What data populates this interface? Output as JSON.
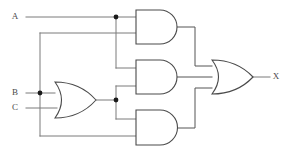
{
  "diagram": {
    "type": "combinational-logic-circuit",
    "background_color": "#ffffff",
    "wire_color": "#7a7a7a",
    "gate_outline_color": "#4a4a4a",
    "junction_color": "#1a1a1a",
    "label_color": "#4a4a4a"
  },
  "inputs": [
    {
      "id": "A",
      "label": "A",
      "label_x": 18,
      "label_y": 17,
      "wire_y": 17
    },
    {
      "id": "B",
      "label": "B",
      "label_x": 18,
      "label_y": 93,
      "wire_y": 93
    },
    {
      "id": "C",
      "label": "C",
      "label_x": 18,
      "label_y": 108,
      "wire_y": 108
    }
  ],
  "outputs": [
    {
      "id": "X",
      "label": "X",
      "label_x": 274,
      "label_y": 77,
      "wire_y": 77
    }
  ],
  "gates": [
    {
      "id": "or1",
      "name": "or-gate-bc",
      "type": "OR",
      "symbol_label": "OR",
      "x": 55,
      "y": 82,
      "width": 41,
      "height": 36,
      "inputs": [
        "B",
        "C"
      ],
      "output": "B+C"
    },
    {
      "id": "and1",
      "name": "and-gate-top",
      "type": "AND",
      "symbol_label": "AND",
      "x": 136,
      "y": 10,
      "width": 41,
      "height": 34,
      "inputs": [
        "A",
        "B"
      ],
      "output": "A*B"
    },
    {
      "id": "and2",
      "name": "and-gate-middle",
      "type": "AND",
      "symbol_label": "AND",
      "x": 136,
      "y": 60,
      "width": 41,
      "height": 34,
      "inputs": [
        "A",
        "B+C"
      ],
      "output": "A*(B+C)"
    },
    {
      "id": "and3",
      "name": "and-gate-bottom",
      "type": "AND",
      "symbol_label": "AND",
      "x": 136,
      "y": 110,
      "width": 41,
      "height": 35,
      "inputs": [
        "B+C",
        "B"
      ],
      "output": "(B+C)*B"
    },
    {
      "id": "or2",
      "name": "or-gate-output",
      "type": "OR",
      "symbol_label": "OR",
      "x": 212,
      "y": 60,
      "width": 41,
      "height": 34,
      "inputs": [
        "A*B",
        "A*(B+C)",
        "(B+C)*B"
      ],
      "output": "X"
    }
  ],
  "junctions": [
    {
      "id": "j-a",
      "name": "junction-a-branch",
      "x": 116,
      "y": 17
    },
    {
      "id": "j-b",
      "name": "junction-b-branch",
      "x": 40,
      "y": 93
    },
    {
      "id": "j-or1",
      "name": "junction-or1-output",
      "x": 116,
      "y": 100
    }
  ],
  "wires": [
    {
      "id": "w-a-in",
      "name": "wire-a-input",
      "path": "M 26 17 L 116 17"
    },
    {
      "id": "w-a-and1",
      "name": "wire-a-to-and1",
      "path": "M 116 17 L 136 17"
    },
    {
      "id": "w-a-down",
      "name": "wire-a-branch-down",
      "path": "M 116 17 L 116 68"
    },
    {
      "id": "w-a-and2",
      "name": "wire-a-to-and2",
      "path": "M 116 68 L 136 68"
    },
    {
      "id": "w-b-in",
      "name": "wire-b-input",
      "path": "M 26 93 L 55 93"
    },
    {
      "id": "w-c-in",
      "name": "wire-c-input",
      "path": "M 26 108 L 57 108"
    },
    {
      "id": "w-b-up",
      "name": "wire-b-branch-up",
      "path": "M 40 93 L 40 33"
    },
    {
      "id": "w-b-top",
      "name": "wire-b-to-and1",
      "path": "M 40 33 L 136 33"
    },
    {
      "id": "w-b-down",
      "name": "wire-b-branch-down",
      "path": "M 40 93 L 40 136"
    },
    {
      "id": "w-b-bottom",
      "name": "wire-b-to-and3",
      "path": "M 40 136 L 136 136"
    },
    {
      "id": "w-or1-out",
      "name": "wire-or1-output",
      "path": "M 96 100 L 116 100"
    },
    {
      "id": "w-or1-up",
      "name": "wire-or1-branch-up",
      "path": "M 116 100 L 116 86"
    },
    {
      "id": "w-or1-and2",
      "name": "wire-or1-to-and2",
      "path": "M 116 86 L 136 86"
    },
    {
      "id": "w-or1-dn",
      "name": "wire-or1-branch-down",
      "path": "M 116 100 L 116 119"
    },
    {
      "id": "w-or1-and3",
      "name": "wire-or1-to-and3",
      "path": "M 116 119 L 136 119"
    },
    {
      "id": "w-and1-out",
      "name": "wire-and1-to-or2",
      "path": "M 177 27 L 195 27 L 195 66 L 212 66"
    },
    {
      "id": "w-and2-out",
      "name": "wire-and2-to-or2",
      "path": "M 177 77 L 212 77"
    },
    {
      "id": "w-and3-out",
      "name": "wire-and3-to-or2",
      "path": "M 177 128 L 195 128 L 195 88 L 212 88"
    },
    {
      "id": "w-x-out",
      "name": "wire-output-x",
      "path": "M 253 77 L 270 77"
    }
  ],
  "boolean_expression": "X = (A·B) + (A·(B+C)) + ((B+C)·B)"
}
